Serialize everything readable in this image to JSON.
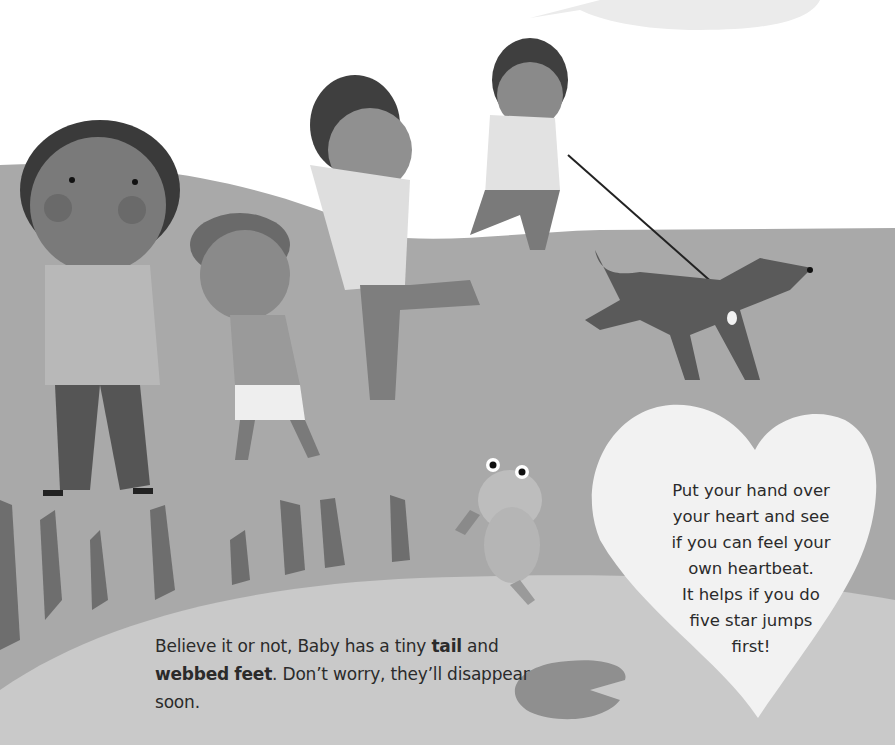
{
  "page": {
    "caption": {
      "part1": "Believe it or not, Baby has a tiny ",
      "bold1": "tail",
      "part2": " and ",
      "bold2": "webbed",
      "part3": " ",
      "bold3": "feet",
      "part4": ". Don’t worry, they’ll disappear soon."
    },
    "heart_box": {
      "lines": [
        "Put your hand over",
        "your heart and see",
        "if you can feel your",
        "own heartbeat.",
        "It helps if you do",
        "five star jumps",
        "first!"
      ]
    },
    "illustration": {
      "elements": [
        "speech-bubble",
        "hill",
        "child-1",
        "child-2",
        "child-3",
        "child-4-with-leash",
        "dog",
        "frog",
        "reeds",
        "lily-pad",
        "heart"
      ]
    },
    "colors": {
      "sky": "#ffffff",
      "hill": "#a9a9a9",
      "ground": "#c9c9c9",
      "heart": "#f2f2f2",
      "lilypad": "#8f8f8f",
      "skin_dark": "#7a7a7a",
      "hair": "#3a3a3a",
      "text": "#2b2b2b"
    }
  }
}
